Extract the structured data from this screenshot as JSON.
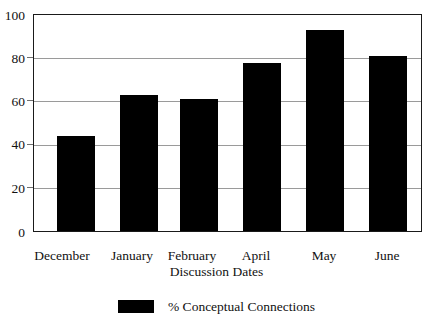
{
  "chart_data": {
    "type": "bar",
    "title": "",
    "subtitle": "",
    "categories": [
      "December",
      "January",
      "February",
      "April",
      "May",
      "June"
    ],
    "values": [
      44,
      63,
      61,
      78,
      93,
      81
    ],
    "series": [
      {
        "name": "% Conceptual Connections",
        "values": [
          44,
          63,
          61,
          78,
          93,
          81
        ],
        "color": "#000000"
      }
    ],
    "xlabel": "Discussion Dates",
    "ylabel": "",
    "ylim": [
      0,
      100
    ],
    "yticks": [
      0,
      20,
      40,
      60,
      80,
      100
    ],
    "ytick_labels": [
      "0",
      "20",
      "40",
      "60",
      "80",
      "100"
    ],
    "grid": true,
    "grid_axis": "y",
    "legend": {
      "position": "bottom-center",
      "entries": [
        {
          "label": "% Conceptual Connections",
          "color": "#000000"
        }
      ]
    },
    "bar_color": "#000000",
    "frame_color": "#1a1a1a",
    "gridline_color": "#9a9a9a",
    "background": "#ffffff"
  },
  "axis": {
    "y_labels": [
      "100",
      "80",
      "60",
      "40",
      "20",
      "0"
    ],
    "x_labels": [
      "December",
      "January",
      "February",
      "April",
      "May",
      "June"
    ],
    "x_title": "Discussion Dates"
  },
  "legend": {
    "swatch_name": "legend-swatch-conceptual-connections",
    "label": "% Conceptual Connections"
  }
}
